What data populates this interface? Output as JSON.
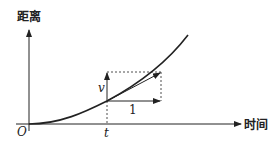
{
  "diagram": {
    "y_axis_label": "距离",
    "x_axis_label": "时间",
    "origin_label": "O",
    "t_label": "t",
    "v_label": "v",
    "unit_label": "1",
    "colors": {
      "line": "#222222",
      "background": "#ffffff"
    }
  }
}
